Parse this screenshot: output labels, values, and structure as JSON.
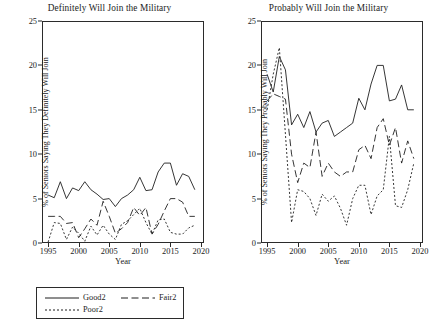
{
  "figure": {
    "panels": [
      {
        "id": "definitely",
        "title": "Definitely Will Join the Military",
        "ylabel": "% of Seniors Saying They  Definitely Will Join",
        "xlabel": "Year",
        "legend": [
          {
            "label": "Good2",
            "style": "solid"
          },
          {
            "label": "Fair2",
            "style": "dashed"
          },
          {
            "label": "Poor2",
            "style": "dotted"
          }
        ]
      },
      {
        "id": "probably",
        "title": "Probably Will Join the Military",
        "ylabel": "% of Seniors Saying They  Probably Will Join",
        "xlabel": "Year",
        "legend": [
          {
            "label": "Good",
            "style": "solid"
          },
          {
            "label": "Fair",
            "style": "dashed"
          },
          {
            "label": "Poor",
            "style": "dotted"
          }
        ]
      }
    ]
  },
  "chart_data": [
    {
      "type": "line",
      "title": "Definitely Will Join the Military",
      "xlabel": "Year",
      "ylabel": "% of Seniors Saying They  Definitely Will Join",
      "xlim": [
        1994,
        2020.5
      ],
      "ylim": [
        0,
        25
      ],
      "xticks": [
        1995,
        2000,
        2005,
        2010,
        2015,
        2020
      ],
      "yticks": [
        0,
        5,
        10,
        15,
        20,
        25
      ],
      "grid": false,
      "legend_position": "below",
      "x": [
        1995,
        1996,
        1997,
        1998,
        1999,
        2000,
        2001,
        2002,
        2003,
        2004,
        2005,
        2006,
        2007,
        2008,
        2009,
        2010,
        2011,
        2012,
        2013,
        2014,
        2015,
        2016,
        2017,
        2018,
        2019
      ],
      "series": [
        {
          "name": "Good2",
          "style": "solid",
          "values": [
            5.4,
            5.1,
            6.9,
            5.0,
            6.2,
            5.9,
            6.9,
            6.0,
            5.5,
            4.9,
            5.0,
            4.1,
            5.0,
            5.4,
            6.0,
            7.4,
            5.9,
            6.0,
            8.0,
            9.0,
            9.0,
            6.5,
            7.8,
            7.5,
            6.0
          ]
        },
        {
          "name": "Fair2",
          "style": "dashed",
          "values": [
            3.0,
            3.0,
            3.0,
            2.2,
            2.3,
            0.6,
            1.6,
            2.7,
            2.0,
            4.7,
            3.0,
            1.1,
            1.6,
            2.3,
            4.0,
            3.1,
            4.0,
            1.0,
            2.1,
            3.6,
            5.0,
            5.0,
            4.6,
            3.0,
            3.0
          ]
        },
        {
          "name": "Poor2",
          "style": "dotted",
          "values": [
            0.1,
            2.3,
            2.2,
            0.4,
            1.8,
            1.1,
            0.2,
            1.9,
            0.9,
            2.0,
            1.0,
            0.4,
            2.1,
            2.5,
            3.2,
            3.9,
            2.3,
            1.0,
            2.6,
            2.7,
            1.2,
            1.0,
            1.0,
            1.7,
            2.0
          ]
        }
      ]
    },
    {
      "type": "line",
      "title": "Probably Will Join the Military",
      "xlabel": "Year",
      "ylabel": "% of Seniors Saying They  Probably Will Join",
      "xlim": [
        1994,
        2020.5
      ],
      "ylim": [
        0,
        25
      ],
      "xticks": [
        1995,
        2000,
        2005,
        2010,
        2015,
        2020
      ],
      "yticks": [
        0,
        5,
        10,
        15,
        20,
        25
      ],
      "grid": false,
      "legend_position": "below",
      "x": [
        1995,
        1996,
        1997,
        1998,
        1999,
        2000,
        2001,
        2002,
        2003,
        2004,
        2005,
        2006,
        2007,
        2008,
        2009,
        2010,
        2011,
        2012,
        2013,
        2014,
        2015,
        2016,
        2017,
        2018,
        2019
      ],
      "series": [
        {
          "name": "Good",
          "style": "solid",
          "values": [
            19.0,
            17.0,
            21.0,
            19.5,
            13.3,
            14.5,
            13.0,
            14.8,
            12.5,
            13.5,
            13.8,
            12.0,
            12.5,
            13.0,
            13.5,
            16.3,
            15.0,
            17.9,
            20.0,
            20.0,
            16.0,
            16.2,
            17.8,
            15.0,
            15.0
          ]
        },
        {
          "name": "Fair",
          "style": "dashed",
          "values": [
            16.0,
            16.8,
            16.5,
            16.2,
            10.0,
            6.8,
            9.0,
            8.5,
            12.5,
            7.5,
            9.0,
            8.0,
            7.5,
            8.0,
            8.0,
            10.5,
            11.0,
            9.5,
            13.0,
            14.0,
            11.0,
            13.0,
            9.0,
            11.5,
            9.5
          ]
        },
        {
          "name": "Poor",
          "style": "dotted",
          "values": [
            15.0,
            19.0,
            22.0,
            12.2,
            2.3,
            6.0,
            5.8,
            5.0,
            3.1,
            5.5,
            4.7,
            5.3,
            3.9,
            2.0,
            5.0,
            6.5,
            6.5,
            3.2,
            5.3,
            6.0,
            12.0,
            4.2,
            4.0,
            6.0,
            9.0
          ]
        }
      ]
    }
  ]
}
